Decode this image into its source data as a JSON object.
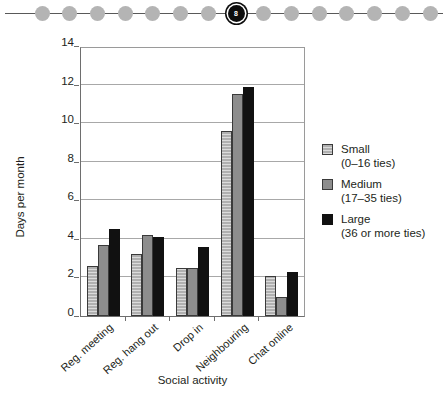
{
  "dot_rail": {
    "total_dots": 15,
    "active_index": 7,
    "active_label": "8"
  },
  "chart_data": {
    "type": "bar",
    "title": "",
    "xlabel": "Social activity",
    "ylabel": "Days per month",
    "ylim": [
      0,
      14
    ],
    "yticks": [
      0,
      2,
      4,
      6,
      8,
      10,
      12,
      14
    ],
    "grid": true,
    "grid_axis": "y",
    "legend_position": "right",
    "categories": [
      "Reg. meeting",
      "Reg. hang out",
      "Drop in",
      "Neighbouring",
      "Chat online"
    ],
    "series": [
      {
        "name": "Small",
        "sublabel": "(0–16 ties)",
        "color": "#b0b0b0",
        "pattern": "horizontal-hatch",
        "values": [
          2.6,
          3.2,
          2.5,
          9.6,
          2.05
        ]
      },
      {
        "name": "Medium",
        "sublabel": "(17–35 ties)",
        "color": "#8d8d8d",
        "pattern": "solid",
        "values": [
          3.7,
          4.2,
          2.5,
          11.5,
          1.0
        ]
      },
      {
        "name": "Large",
        "sublabel": "(36 or more ties)",
        "color": "#111111",
        "pattern": "solid",
        "values": [
          4.5,
          4.1,
          3.6,
          11.85,
          2.3
        ]
      }
    ]
  }
}
